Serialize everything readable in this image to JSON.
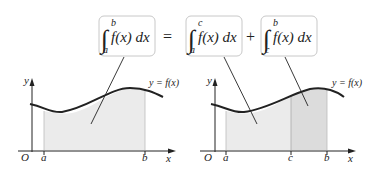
{
  "equation": {
    "lhs": {
      "lower": "a",
      "upper": "b",
      "integrand": "f(x) dx"
    },
    "equals": "=",
    "term1": {
      "lower": "a",
      "upper": "c",
      "integrand": "f(x) dx"
    },
    "plus": "+",
    "term2": {
      "lower": "c",
      "upper": "b",
      "integrand": "f(x) dx"
    }
  },
  "left_graph": {
    "y_label": "y",
    "x_label": "x",
    "origin_label": "O",
    "curve_label": "y = f(x)",
    "ticks": [
      "a",
      "b"
    ]
  },
  "right_graph": {
    "y_label": "y",
    "x_label": "x",
    "origin_label": "O",
    "curve_label": "y = f(x)",
    "ticks": [
      "a",
      "c",
      "b"
    ]
  },
  "colors": {
    "region_light": "#ebebeb",
    "region_dark": "#dcdcdc",
    "box_border": "#c8c8c8",
    "stroke": "#222222"
  }
}
